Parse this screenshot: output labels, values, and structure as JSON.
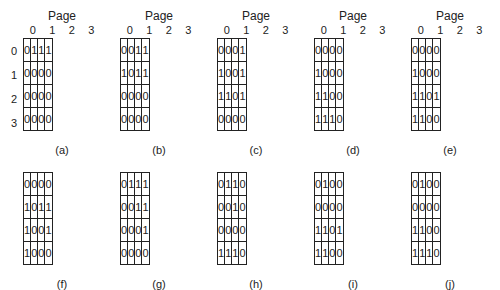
{
  "axis_label": "Page",
  "column_indices": [
    "0",
    "1",
    "2",
    "3"
  ],
  "row_indices": [
    "0",
    "1",
    "2",
    "3"
  ],
  "matrices": [
    {
      "caption": "(a)",
      "rows": [
        [
          "0",
          "1",
          "1",
          "1"
        ],
        [
          "0",
          "0",
          "0",
          "0"
        ],
        [
          "0",
          "0",
          "0",
          "0"
        ],
        [
          "0",
          "0",
          "0",
          "0"
        ]
      ]
    },
    {
      "caption": "(b)",
      "rows": [
        [
          "0",
          "0",
          "1",
          "1"
        ],
        [
          "1",
          "0",
          "1",
          "1"
        ],
        [
          "0",
          "0",
          "0",
          "0"
        ],
        [
          "0",
          "0",
          "0",
          "0"
        ]
      ]
    },
    {
      "caption": "(c)",
      "rows": [
        [
          "0",
          "0",
          "0",
          "1"
        ],
        [
          "1",
          "0",
          "0",
          "1"
        ],
        [
          "1",
          "1",
          "0",
          "1"
        ],
        [
          "0",
          "0",
          "0",
          "0"
        ]
      ]
    },
    {
      "caption": "(d)",
      "rows": [
        [
          "0",
          "0",
          "0",
          "0"
        ],
        [
          "1",
          "0",
          "0",
          "0"
        ],
        [
          "1",
          "1",
          "0",
          "0"
        ],
        [
          "1",
          "1",
          "1",
          "0"
        ]
      ]
    },
    {
      "caption": "(e)",
      "rows": [
        [
          "0",
          "0",
          "0",
          "0"
        ],
        [
          "1",
          "0",
          "0",
          "0"
        ],
        [
          "1",
          "1",
          "0",
          "1"
        ],
        [
          "1",
          "1",
          "0",
          "0"
        ]
      ]
    },
    {
      "caption": "(f)",
      "rows": [
        [
          "0",
          "0",
          "0",
          "0"
        ],
        [
          "1",
          "0",
          "1",
          "1"
        ],
        [
          "1",
          "0",
          "0",
          "1"
        ],
        [
          "1",
          "0",
          "0",
          "0"
        ]
      ]
    },
    {
      "caption": "(g)",
      "rows": [
        [
          "0",
          "1",
          "1",
          "1"
        ],
        [
          "0",
          "0",
          "1",
          "1"
        ],
        [
          "0",
          "0",
          "0",
          "1"
        ],
        [
          "0",
          "0",
          "0",
          "0"
        ]
      ]
    },
    {
      "caption": "(h)",
      "rows": [
        [
          "0",
          "1",
          "1",
          "0"
        ],
        [
          "0",
          "0",
          "1",
          "0"
        ],
        [
          "0",
          "0",
          "0",
          "0"
        ],
        [
          "1",
          "1",
          "1",
          "0"
        ]
      ]
    },
    {
      "caption": "(i)",
      "rows": [
        [
          "0",
          "1",
          "0",
          "0"
        ],
        [
          "0",
          "0",
          "0",
          "0"
        ],
        [
          "1",
          "1",
          "0",
          "1"
        ],
        [
          "1",
          "1",
          "0",
          "0"
        ]
      ]
    },
    {
      "caption": "(j)",
      "rows": [
        [
          "0",
          "1",
          "0",
          "0"
        ],
        [
          "0",
          "0",
          "0",
          "0"
        ],
        [
          "1",
          "1",
          "0",
          "0"
        ],
        [
          "1",
          "1",
          "1",
          "0"
        ]
      ]
    }
  ]
}
